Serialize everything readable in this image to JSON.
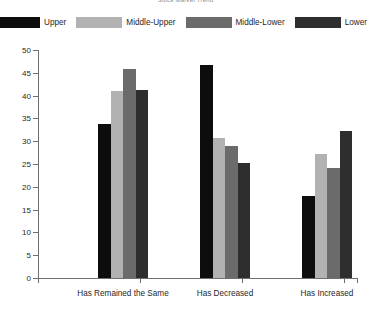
{
  "chart_data": {
    "type": "bar",
    "title": "Stock Market Trend",
    "xlabel": "",
    "ylabel": "",
    "ylim": [
      0,
      50
    ],
    "yticks": [
      0,
      5,
      10,
      15,
      20,
      25,
      30,
      35,
      40,
      45,
      50
    ],
    "ytick_labels": [
      "0",
      "5",
      "10",
      "15",
      "20",
      "25",
      "30",
      "35",
      "40",
      "45",
      "50"
    ],
    "grid": false,
    "legend_position": "top",
    "categories": [
      "Has Remained the Same",
      "Has Decreased",
      "Has Increased"
    ],
    "series": [
      {
        "name": "Upper",
        "color": "#0d0d0d",
        "values": [
          33.8,
          46.7,
          18.0
        ]
      },
      {
        "name": "Middle-Upper",
        "color": "#b2b2b2",
        "values": [
          41.1,
          30.8,
          27.3
        ]
      },
      {
        "name": "Middle-Lower",
        "color": "#6b6b6b",
        "values": [
          45.9,
          29.0,
          24.1
        ]
      },
      {
        "name": "Lower",
        "color": "#2e2e2e",
        "values": [
          41.2,
          25.2,
          32.3
        ]
      }
    ]
  },
  "axis": {
    "tick_color": "#6f6f6f",
    "label_color": "#1f1f1f"
  }
}
